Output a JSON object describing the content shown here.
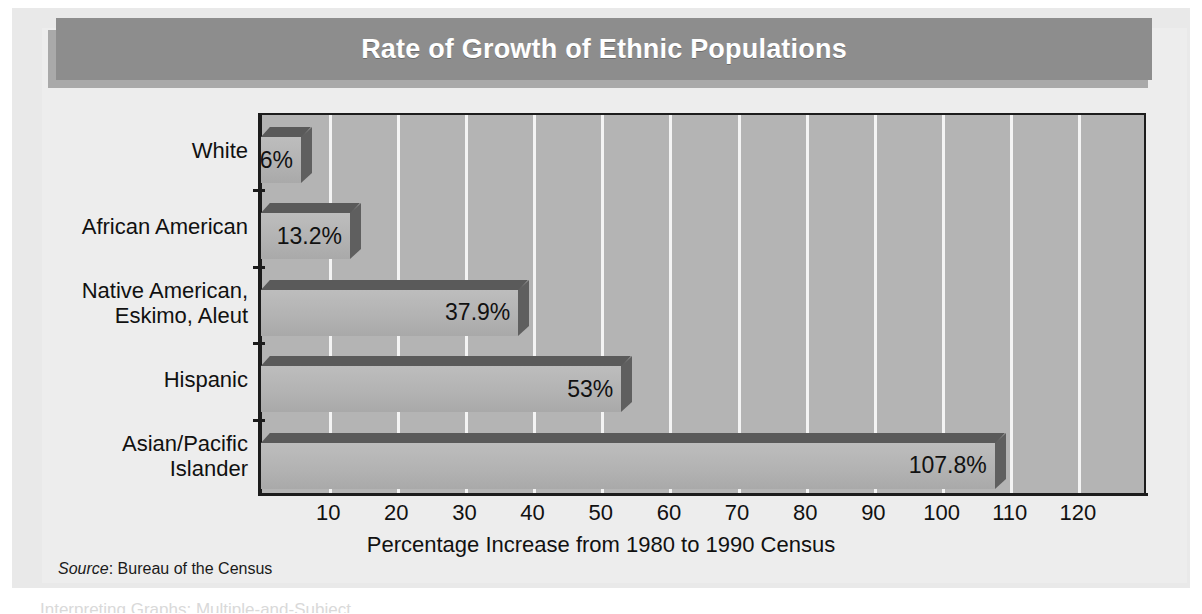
{
  "banner": {
    "title": "Rate of Growth of Ethnic Populations"
  },
  "source_note": {
    "prefix": "Source",
    "text": ": Bureau of the Census"
  },
  "bottom_fragment": "Interpreting Graphs: Multiple-and-Subject",
  "colors": {
    "banner_bg": "#8d8d8d",
    "banner_shadow": "#a9a9a9",
    "plot_bg": "#b4b4b4",
    "gridline": "#f4f4f4",
    "bar_front": "#b2b2b2",
    "bar_top": "#5a5a5a",
    "bar_side": "#5f5f5f",
    "axis": "#1c1c1c",
    "board_bg": "#e9e9e9"
  },
  "chart_data": {
    "type": "bar",
    "orientation": "horizontal",
    "title": "Rate of Growth of Ethnic Populations",
    "xlabel": "Percentage Increase from 1980 to 1990 Census",
    "ylabel": "",
    "xlim": [
      0,
      130
    ],
    "xticks": [
      10,
      20,
      30,
      40,
      50,
      60,
      70,
      80,
      90,
      100,
      110,
      120
    ],
    "xtick_labels": [
      "10",
      "20",
      "30",
      "40",
      "50",
      "60",
      "70",
      "80",
      "90",
      "100",
      "110",
      "120"
    ],
    "grid": "vertical-white",
    "legend": null,
    "categories": [
      "White",
      "African American",
      "Native American,\nEskimo, Aleut",
      "Hispanic",
      "Asian/Pacific\nIslander"
    ],
    "values": [
      6,
      13.2,
      37.9,
      53,
      107.8
    ],
    "data_labels": [
      "6%",
      "13.2%",
      "37.9%",
      "53%",
      "107.8%"
    ],
    "source": "Source: Bureau of the Census"
  }
}
